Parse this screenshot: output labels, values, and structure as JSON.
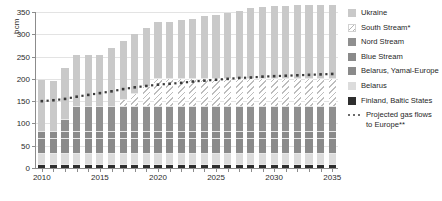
{
  "axes": {
    "ylabel": "bcm",
    "yticks": [
      0,
      50,
      100,
      150,
      200,
      250,
      300,
      350
    ],
    "ylim": [
      0,
      350
    ],
    "xticks": [
      2010,
      2015,
      2020,
      2025,
      2030,
      2035
    ],
    "xlim": [
      2010,
      2035
    ]
  },
  "legend": {
    "items": [
      {
        "label": "Ukraine",
        "key": "ukraine",
        "color": "#c9c9c9"
      },
      {
        "label": "South Stream*",
        "key": "south",
        "color": "#f2f2f2"
      },
      {
        "label": "Nord Stream",
        "key": "nord",
        "color": "#8f8f8f"
      },
      {
        "label": "Blue Stream",
        "key": "blue",
        "color": "#8a8a8a"
      },
      {
        "label": "Belarus, Yamal-Europe",
        "key": "yamal",
        "color": "#8a8a8a"
      },
      {
        "label": "Belarus",
        "key": "belarus",
        "color": "#dcdcdc"
      },
      {
        "label": "Finland, Baltic States",
        "key": "finland",
        "color": "#2e2e2e"
      }
    ],
    "projected_label": "Projected gas flows to Europe**"
  },
  "chart_data": {
    "type": "bar",
    "title": "",
    "xlabel": "",
    "ylabel": "bcm",
    "ylim": [
      0,
      350
    ],
    "grid": true,
    "legend_position": "right",
    "stacked": true,
    "categories": [
      2010,
      2011,
      2012,
      2013,
      2014,
      2015,
      2016,
      2017,
      2018,
      2019,
      2020,
      2021,
      2022,
      2023,
      2024,
      2025,
      2026,
      2027,
      2028,
      2029,
      2030,
      2031,
      2032,
      2033,
      2034,
      2035
    ],
    "series": [
      {
        "name": "Finland, Baltic States",
        "color": "#2e2e2e",
        "values": [
          9,
          9,
          9,
          9,
          9,
          9,
          9,
          9,
          9,
          9,
          9,
          9,
          9,
          9,
          9,
          9,
          9,
          9,
          9,
          9,
          9,
          9,
          9,
          9,
          9,
          9
        ]
      },
      {
        "name": "Belarus",
        "color": "#dcdcdc",
        "values": [
          25,
          25,
          25,
          25,
          25,
          25,
          25,
          25,
          25,
          25,
          25,
          25,
          25,
          25,
          25,
          25,
          25,
          25,
          25,
          25,
          25,
          25,
          25,
          25,
          25,
          25
        ]
      },
      {
        "name": "Belarus, Yamal-Europe",
        "color": "#8a8a8a",
        "values": [
          33,
          33,
          33,
          33,
          33,
          33,
          33,
          33,
          33,
          33,
          33,
          33,
          33,
          33,
          33,
          33,
          33,
          33,
          33,
          33,
          33,
          33,
          33,
          33,
          33,
          33
        ]
      },
      {
        "name": "Blue Stream",
        "color": "#8a8a8a",
        "values": [
          16,
          16,
          16,
          16,
          16,
          16,
          16,
          16,
          16,
          16,
          16,
          16,
          16,
          16,
          16,
          16,
          16,
          16,
          16,
          16,
          16,
          16,
          16,
          16,
          16,
          16
        ]
      },
      {
        "name": "Nord Stream",
        "color": "#8f8f8f",
        "values": [
          0,
          0,
          27,
          55,
          55,
          55,
          55,
          55,
          55,
          55,
          55,
          55,
          55,
          55,
          55,
          55,
          55,
          55,
          55,
          55,
          55,
          55,
          55,
          55,
          55,
          55
        ]
      },
      {
        "name": "South Stream*",
        "color": "#f2f2f2",
        "values": [
          0,
          0,
          0,
          0,
          0,
          0,
          0,
          16,
          31,
          47,
          63,
          63,
          63,
          63,
          63,
          63,
          63,
          63,
          63,
          63,
          63,
          63,
          63,
          63,
          63,
          63
        ]
      },
      {
        "name": "Ukraine",
        "color": "#c9c9c9",
        "values": [
          115,
          113,
          115,
          115,
          115,
          115,
          131,
          131,
          131,
          129,
          127,
          127,
          130,
          134,
          139,
          142,
          147,
          152,
          157,
          160,
          162,
          163,
          164,
          164,
          164,
          165
        ]
      }
    ],
    "totals": [
      198,
      196,
      225,
      253,
      253,
      253,
      269,
      285,
      300,
      314,
      317,
      317,
      320,
      324,
      329,
      332,
      337,
      342,
      347,
      350,
      352,
      353,
      354,
      354,
      354,
      355
    ],
    "overlay": {
      "name": "Projected gas flows to Europe**",
      "type": "line",
      "style": "dotted",
      "color": "#3a3a3a",
      "x": [
        2010,
        2011,
        2012,
        2013,
        2014,
        2015,
        2016,
        2017,
        2018,
        2019,
        2020,
        2021,
        2022,
        2023,
        2024,
        2025,
        2026,
        2027,
        2028,
        2029,
        2030,
        2031,
        2032,
        2033,
        2034,
        2035
      ],
      "values": [
        150,
        152,
        155,
        160,
        164,
        168,
        172,
        177,
        181,
        184,
        187,
        189,
        191,
        194,
        196,
        198,
        200,
        202,
        203,
        205,
        206,
        207,
        208,
        209,
        210,
        211
      ]
    }
  }
}
